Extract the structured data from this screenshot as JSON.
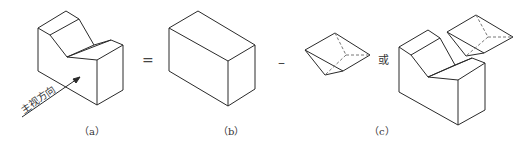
{
  "figure": {
    "labels": {
      "a": "（a）",
      "b": "（b）",
      "c": "（c）"
    },
    "operators": {
      "equals": "=",
      "minus": "–",
      "or": "或"
    },
    "view_direction_text": "主视方向",
    "stroke_color": "#2a2a2a",
    "hidden_line_color": "#777777"
  }
}
